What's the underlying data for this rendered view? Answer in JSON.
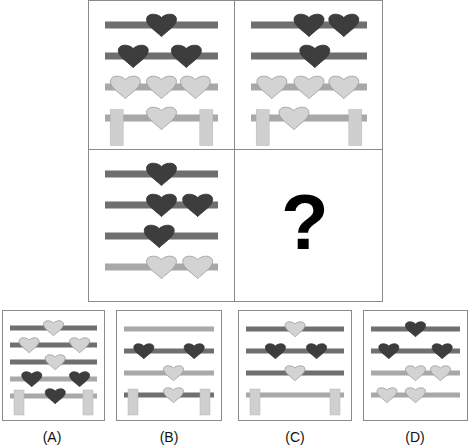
{
  "colors": {
    "dark_bar": "#6f6f6f",
    "light_bar": "#a8a8a8",
    "dark_heart": "#3d3d3d",
    "light_heart": "#d3d3d3",
    "light_heart_stroke": "#9a9a9a",
    "post": "#cfcfcf",
    "border": "#8a8a8a"
  },
  "question_mark": "?",
  "grid": {
    "cells": [
      {
        "id": "r1c1",
        "rows": [
          {
            "bar": "dark",
            "hearts": [
              {
                "pos": 0.5,
                "tone": "dark"
              }
            ]
          },
          {
            "bar": "dark",
            "hearts": [
              {
                "pos": 0.25,
                "tone": "dark"
              },
              {
                "pos": 0.72,
                "tone": "dark"
              }
            ]
          },
          {
            "bar": "light",
            "hearts": [
              {
                "pos": 0.18,
                "tone": "light"
              },
              {
                "pos": 0.5,
                "tone": "light"
              },
              {
                "pos": 0.8,
                "tone": "light"
              }
            ]
          },
          {
            "bar": "light",
            "posts": true,
            "hearts": [
              {
                "pos": 0.5,
                "tone": "light"
              }
            ]
          }
        ]
      },
      {
        "id": "r1c2",
        "rows": [
          {
            "bar": "dark",
            "hearts": [
              {
                "pos": 0.5,
                "tone": "dark"
              },
              {
                "pos": 0.8,
                "tone": "dark"
              }
            ]
          },
          {
            "bar": "dark",
            "hearts": [
              {
                "pos": 0.55,
                "tone": "dark"
              }
            ]
          },
          {
            "bar": "light",
            "hearts": [
              {
                "pos": 0.18,
                "tone": "light"
              },
              {
                "pos": 0.5,
                "tone": "light"
              },
              {
                "pos": 0.8,
                "tone": "light"
              }
            ]
          },
          {
            "bar": "light",
            "posts": true,
            "hearts": [
              {
                "pos": 0.37,
                "tone": "light"
              }
            ]
          }
        ]
      },
      {
        "id": "r2c1",
        "rows": [
          {
            "bar": "dark",
            "hearts": [
              {
                "pos": 0.5,
                "tone": "dark"
              }
            ]
          },
          {
            "bar": "dark",
            "hearts": [
              {
                "pos": 0.5,
                "tone": "dark"
              },
              {
                "pos": 0.82,
                "tone": "dark"
              }
            ]
          },
          {
            "bar": "dark",
            "hearts": [
              {
                "pos": 0.48,
                "tone": "dark"
              }
            ]
          },
          {
            "bar": "light",
            "hearts": [
              {
                "pos": 0.5,
                "tone": "light"
              },
              {
                "pos": 0.82,
                "tone": "light"
              }
            ]
          }
        ]
      },
      {
        "id": "r2c2",
        "question": true
      }
    ]
  },
  "options": [
    {
      "label": "(A)",
      "rows": [
        {
          "bar": "dark",
          "hearts": [
            {
              "pos": 0.5,
              "tone": "light"
            }
          ]
        },
        {
          "bar": "dark",
          "hearts": [
            {
              "pos": 0.22,
              "tone": "light"
            },
            {
              "pos": 0.8,
              "tone": "light"
            }
          ]
        },
        {
          "bar": "dark",
          "hearts": [
            {
              "pos": 0.52,
              "tone": "light"
            }
          ]
        },
        {
          "bar": "light",
          "hearts": [
            {
              "pos": 0.25,
              "tone": "dark"
            },
            {
              "pos": 0.8,
              "tone": "dark"
            }
          ]
        },
        {
          "bar": "light",
          "posts": true,
          "hearts": [
            {
              "pos": 0.52,
              "tone": "dark"
            }
          ]
        }
      ]
    },
    {
      "label": "(B)",
      "rows": [
        {
          "bar": "light",
          "hearts": []
        },
        {
          "bar": "dark",
          "hearts": [
            {
              "pos": 0.22,
              "tone": "dark"
            },
            {
              "pos": 0.78,
              "tone": "dark"
            }
          ]
        },
        {
          "bar": "light",
          "hearts": [
            {
              "pos": 0.55,
              "tone": "light"
            }
          ]
        },
        {
          "bar": "dark",
          "posts": true,
          "hearts": [
            {
              "pos": 0.55,
              "tone": "light"
            }
          ]
        }
      ]
    },
    {
      "label": "(C)",
      "rows": [
        {
          "bar": "dark",
          "hearts": [
            {
              "pos": 0.5,
              "tone": "light"
            }
          ]
        },
        {
          "bar": "dark",
          "hearts": [
            {
              "pos": 0.3,
              "tone": "dark"
            },
            {
              "pos": 0.72,
              "tone": "dark"
            }
          ]
        },
        {
          "bar": "dark",
          "hearts": [
            {
              "pos": 0.5,
              "tone": "light"
            }
          ]
        },
        {
          "bar": "light",
          "posts": true,
          "hearts": []
        }
      ]
    },
    {
      "label": "(D)",
      "rows": [
        {
          "bar": "dark",
          "hearts": [
            {
              "pos": 0.5,
              "tone": "dark"
            }
          ]
        },
        {
          "bar": "dark",
          "hearts": [
            {
              "pos": 0.2,
              "tone": "dark"
            },
            {
              "pos": 0.8,
              "tone": "dark"
            }
          ]
        },
        {
          "bar": "light",
          "hearts": [
            {
              "pos": 0.5,
              "tone": "light"
            },
            {
              "pos": 0.78,
              "tone": "light"
            }
          ]
        },
        {
          "bar": "light",
          "hearts": [
            {
              "pos": 0.18,
              "tone": "light"
            },
            {
              "pos": 0.5,
              "tone": "light"
            }
          ]
        }
      ]
    }
  ]
}
